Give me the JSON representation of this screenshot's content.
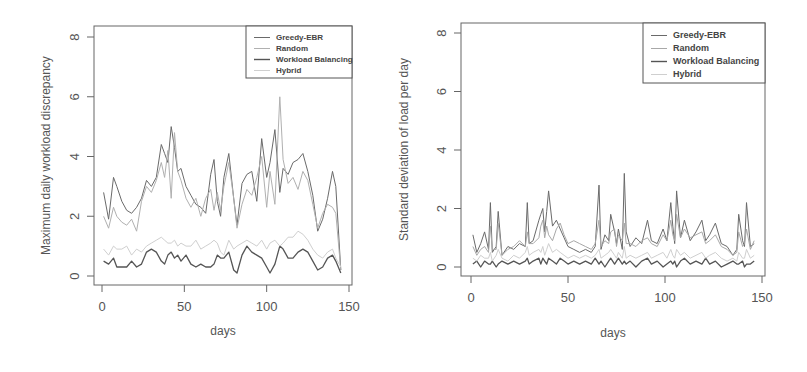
{
  "chart_data": [
    {
      "type": "line",
      "title": "",
      "xlabel": "days",
      "ylabel": "Maximum daily workload discrepancy",
      "xlim": [
        0,
        150
      ],
      "ylim": [
        0,
        8
      ],
      "xticks": [
        0,
        50,
        100,
        150
      ],
      "yticks": [
        0,
        2,
        4,
        6,
        8
      ],
      "grid": false,
      "legend_position": "top-right",
      "legend": [
        "Greedy-EBR",
        "Random",
        "Workload Balancing",
        "Hybrid"
      ],
      "x": [
        1,
        4,
        7,
        9,
        12,
        15,
        18,
        21,
        24,
        27,
        30,
        33,
        36,
        38,
        40,
        42,
        44,
        46,
        48,
        51,
        54,
        57,
        60,
        63,
        66,
        68,
        70,
        72,
        74,
        77,
        80,
        82,
        85,
        88,
        91,
        94,
        97,
        100,
        102,
        105,
        108,
        110,
        113,
        116,
        119,
        122,
        125,
        128,
        131,
        134,
        137,
        140,
        142,
        145
      ],
      "series": [
        {
          "name": "Greedy-EBR",
          "color": "#6a6a6a",
          "values": [
            2.8,
            1.9,
            3.3,
            3.0,
            2.5,
            2.2,
            2.1,
            2.3,
            2.6,
            3.2,
            3.0,
            3.3,
            4.4,
            4.1,
            3.8,
            5.0,
            4.3,
            3.5,
            3.6,
            3.0,
            2.7,
            2.4,
            2.3,
            2.1,
            3.4,
            3.9,
            2.5,
            2.0,
            3.3,
            4.1,
            2.6,
            1.7,
            3.1,
            3.4,
            3.5,
            2.5,
            4.6,
            3.3,
            3.8,
            4.9,
            2.8,
            3.6,
            3.4,
            3.8,
            3.9,
            4.1,
            3.5,
            2.7,
            1.5,
            1.9,
            2.6,
            3.5,
            3.0,
            0.2
          ]
        },
        {
          "name": "Random",
          "color": "#b0b0b0",
          "values": [
            2.0,
            1.6,
            2.3,
            2.0,
            1.8,
            1.7,
            1.9,
            1.5,
            2.5,
            3.0,
            2.8,
            3.2,
            3.8,
            3.3,
            4.2,
            2.6,
            4.8,
            3.5,
            3.2,
            2.6,
            2.3,
            2.6,
            2.0,
            2.6,
            2.9,
            2.2,
            2.8,
            2.2,
            3.0,
            3.8,
            2.6,
            1.6,
            2.4,
            2.9,
            2.7,
            3.3,
            4.0,
            2.3,
            3.5,
            2.4,
            6.0,
            3.9,
            3.1,
            3.3,
            2.9,
            3.5,
            3.2,
            2.4,
            1.6,
            2.1,
            2.4,
            2.3,
            2.1,
            0.2
          ]
        },
        {
          "name": "Workload Balancing",
          "color": "#555555",
          "values": [
            0.5,
            0.4,
            0.6,
            0.3,
            0.3,
            0.3,
            0.5,
            0.3,
            0.4,
            0.8,
            0.9,
            0.8,
            0.5,
            0.4,
            0.7,
            0.8,
            0.6,
            0.7,
            0.5,
            0.7,
            0.4,
            0.3,
            0.4,
            0.3,
            0.3,
            0.4,
            0.7,
            0.6,
            0.6,
            0.8,
            0.2,
            0.1,
            0.7,
            1.0,
            0.8,
            0.7,
            0.6,
            0.3,
            0.1,
            0.4,
            1.0,
            0.9,
            0.6,
            0.6,
            0.8,
            0.9,
            0.8,
            0.5,
            0.2,
            0.3,
            0.6,
            0.7,
            0.5,
            0.1
          ]
        },
        {
          "name": "Hybrid",
          "color": "#cfcfcf",
          "values": [
            0.9,
            0.7,
            1.0,
            0.9,
            0.9,
            1.0,
            0.7,
            0.9,
            0.8,
            1.0,
            1.1,
            1.2,
            1.3,
            1.2,
            1.1,
            1.1,
            1.2,
            1.0,
            1.1,
            1.0,
            1.0,
            1.2,
            0.9,
            1.0,
            1.1,
            1.2,
            1.1,
            0.8,
            0.7,
            1.2,
            0.9,
            1.0,
            1.1,
            1.2,
            1.1,
            1.0,
            1.2,
            0.9,
            1.1,
            1.2,
            1.0,
            1.1,
            1.3,
            1.3,
            1.5,
            1.4,
            1.2,
            0.9,
            0.7,
            0.6,
            0.8,
            0.9,
            0.6,
            0.3
          ]
        }
      ]
    },
    {
      "type": "line",
      "title": "",
      "xlabel": "days",
      "ylabel": "Standard deviation of load per day",
      "xlim": [
        0,
        150
      ],
      "ylim": [
        0,
        8
      ],
      "xticks": [
        0,
        50,
        100,
        150
      ],
      "yticks": [
        0,
        2,
        4,
        6,
        8
      ],
      "grid": false,
      "legend_position": "top-right",
      "legend": [
        "Greedy-EBR",
        "Random",
        "Workload Balancing",
        "Hybrid"
      ],
      "x": [
        1,
        3,
        5,
        7,
        9,
        10,
        11,
        13,
        14,
        16,
        19,
        22,
        25,
        28,
        29,
        30,
        32,
        35,
        36,
        37,
        38,
        39,
        40,
        42,
        44,
        46,
        48,
        50,
        53,
        56,
        59,
        62,
        64,
        66,
        67,
        69,
        71,
        72,
        74,
        75,
        76,
        78,
        79,
        80,
        82,
        85,
        88,
        91,
        93,
        96,
        99,
        101,
        103,
        104,
        105,
        106,
        108,
        110,
        113,
        116,
        119,
        121,
        123,
        126,
        129,
        132,
        135,
        137,
        138,
        140,
        141,
        142,
        144,
        146
      ],
      "series": [
        {
          "name": "Greedy-EBR",
          "color": "#6a6a6a",
          "values": [
            1.1,
            0.5,
            0.8,
            1.2,
            0.6,
            2.2,
            0.5,
            0.7,
            1.9,
            0.4,
            0.7,
            0.6,
            0.8,
            0.7,
            2.2,
            0.8,
            0.9,
            1.6,
            1.8,
            2.0,
            1.2,
            1.9,
            2.6,
            1.4,
            1.6,
            1.3,
            1.0,
            0.7,
            0.6,
            0.5,
            0.6,
            0.5,
            0.7,
            2.8,
            0.6,
            1.1,
            0.9,
            1.8,
            1.2,
            0.8,
            1.3,
            0.6,
            3.2,
            1.2,
            0.7,
            1.0,
            0.8,
            1.6,
            0.9,
            0.8,
            1.3,
            0.9,
            2.2,
            1.4,
            0.8,
            2.6,
            1.0,
            1.6,
            0.9,
            1.2,
            1.6,
            0.9,
            1.1,
            1.5,
            0.8,
            0.7,
            0.4,
            0.6,
            1.8,
            0.9,
            0.7,
            2.2,
            0.7,
            0.8
          ]
        },
        {
          "name": "Random",
          "color": "#a8a8a8",
          "values": [
            0.7,
            0.4,
            0.6,
            0.7,
            0.5,
            1.4,
            0.6,
            0.6,
            1.5,
            0.4,
            0.6,
            0.7,
            0.9,
            0.7,
            1.2,
            0.8,
            0.8,
            1.0,
            1.4,
            1.6,
            1.0,
            1.4,
            1.1,
            0.9,
            1.3,
            1.5,
            1.1,
            0.8,
            0.9,
            0.8,
            0.7,
            0.6,
            0.8,
            1.6,
            0.7,
            0.9,
            0.8,
            1.2,
            1.3,
            0.7,
            1.1,
            0.9,
            1.5,
            0.8,
            0.8,
            0.7,
            0.9,
            1.0,
            0.8,
            0.7,
            1.1,
            0.9,
            1.6,
            1.1,
            0.9,
            1.8,
            1.0,
            1.3,
            1.0,
            1.1,
            1.2,
            0.8,
            0.9,
            1.1,
            0.7,
            0.6,
            0.4,
            0.5,
            1.2,
            0.7,
            0.8,
            1.3,
            0.6,
            0.9
          ]
        },
        {
          "name": "Workload Balancing",
          "color": "#555555",
          "values": [
            0.1,
            0.2,
            0.0,
            0.2,
            0.1,
            0.1,
            0.2,
            0.0,
            0.1,
            0.2,
            0.1,
            0.2,
            0.1,
            0.2,
            0.3,
            0.1,
            0.2,
            0.3,
            0.1,
            0.3,
            0.2,
            0.1,
            0.3,
            0.2,
            0.1,
            0.3,
            0.2,
            0.1,
            0.2,
            0.1,
            0.2,
            0.1,
            0.3,
            0.1,
            0.2,
            0.0,
            0.2,
            0.3,
            0.1,
            0.2,
            0.3,
            0.1,
            0.2,
            0.1,
            0.2,
            0.0,
            0.2,
            0.3,
            0.1,
            0.2,
            0.0,
            0.1,
            0.2,
            0.1,
            0.2,
            0.0,
            0.2,
            0.3,
            0.1,
            0.2,
            0.1,
            0.3,
            0.1,
            0.2,
            0.0,
            0.1,
            0.2,
            0.1,
            0.1,
            0.2,
            0.0,
            0.1,
            0.1,
            0.2
          ]
        },
        {
          "name": "Hybrid",
          "color": "#cfcfcf",
          "values": [
            0.3,
            0.2,
            0.4,
            0.3,
            0.3,
            0.5,
            0.2,
            0.4,
            0.6,
            0.3,
            0.2,
            0.4,
            0.3,
            0.5,
            0.7,
            0.4,
            0.5,
            0.6,
            0.5,
            0.7,
            0.4,
            0.6,
            0.8,
            0.5,
            0.6,
            0.5,
            0.4,
            0.3,
            0.4,
            0.3,
            0.4,
            0.3,
            0.4,
            0.6,
            0.3,
            0.4,
            0.5,
            0.6,
            0.4,
            0.3,
            0.5,
            0.3,
            0.7,
            0.3,
            0.4,
            0.3,
            0.4,
            0.5,
            0.3,
            0.4,
            0.5,
            0.3,
            0.6,
            0.4,
            0.3,
            0.6,
            0.4,
            0.5,
            0.3,
            0.4,
            0.5,
            0.3,
            0.4,
            0.5,
            0.3,
            0.2,
            0.3,
            0.2,
            0.5,
            0.3,
            0.3,
            0.6,
            0.3,
            0.4
          ]
        }
      ]
    }
  ],
  "layout": [
    {
      "frame": {
        "x0": 94,
        "y0": 26,
        "x1": 352,
        "y1": 285
      },
      "xmap": {
        "v0": 0,
        "p0": 102,
        "v1": 150,
        "p1": 349
      },
      "ymap": {
        "v0": 0,
        "p0": 276,
        "v1": 8,
        "p1": 37
      },
      "legend": {
        "x0": 246,
        "y0": 26,
        "x1": 352,
        "y1": 78
      },
      "ylabel_x": 47,
      "xlabel_y": 335
    },
    {
      "frame": {
        "x0": 461,
        "y0": 23,
        "x1": 765,
        "y1": 276
      },
      "xmap": {
        "v0": 0,
        "p0": 471,
        "v1": 150,
        "p1": 762
      },
      "ymap": {
        "v0": 0,
        "p0": 267,
        "v1": 8,
        "p1": 33
      },
      "legend": {
        "x0": 643,
        "y0": 23,
        "x1": 765,
        "y1": 83
      },
      "ylabel_x": 405,
      "xlabel_y": 337
    }
  ]
}
